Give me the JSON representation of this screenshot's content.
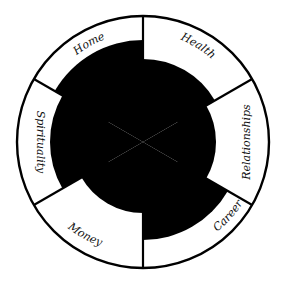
{
  "diagram": {
    "type": "wheel-of-life",
    "center": [
      143,
      142
    ],
    "outer_radius": 126,
    "colors": {
      "fill": "#000000",
      "stroke": "#000000",
      "background": "#ffffff"
    },
    "segments": [
      {
        "label": "Health",
        "start_deg": 90,
        "end_deg": 30,
        "fill_radius": 83
      },
      {
        "label": "Relationships",
        "start_deg": 30,
        "end_deg": -30,
        "fill_radius": 73
      },
      {
        "label": "Career",
        "start_deg": -30,
        "end_deg": -90,
        "fill_radius": 98
      },
      {
        "label": "Money",
        "start_deg": -90,
        "end_deg": -150,
        "fill_radius": 71
      },
      {
        "label": "Spirituality",
        "start_deg": -150,
        "end_deg": -210,
        "fill_radius": 93
      },
      {
        "label": "Home",
        "start_deg": 150,
        "end_deg": 90,
        "fill_radius": 102
      }
    ]
  },
  "labels": {
    "health": "Health",
    "relationships": "Relationships",
    "career": "Career",
    "money": "Money",
    "spirituality": "Spirituality",
    "home": "Home"
  }
}
